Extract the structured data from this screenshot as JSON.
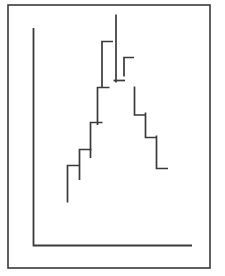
{
  "figure": {
    "title": "",
    "background_color": "#ffffff",
    "ink_color": "#3a3a3a",
    "frame": {
      "name": "outer-border",
      "x": 8,
      "y": 5,
      "width": 202,
      "height": 263,
      "stroke_width": 1.6
    },
    "axes": {
      "name": "axes-lines",
      "stroke_width": 1.8,
      "y_axis": {
        "x": 33.5,
        "y_top": 28,
        "y_bottom": 245.5
      },
      "x_axis": {
        "y": 245.5,
        "x_left": 33.5,
        "x_right": 192
      }
    }
  },
  "chart_data": {
    "type": "bar",
    "title": "",
    "subtitle": "",
    "xlabel": "",
    "ylabel": "",
    "grid": false,
    "legend": null,
    "annotations": [],
    "xlim": [
      0,
      13
    ],
    "ylim": [
      0,
      100
    ],
    "x_tick_labels": [],
    "y_tick_labels": [],
    "categories": [
      "1",
      "2",
      "3",
      "4",
      "5",
      "6",
      "7",
      "8",
      "9",
      "10",
      "11",
      "12"
    ],
    "values": [
      20,
      33,
      47,
      60,
      82,
      100,
      68,
      55,
      42,
      30,
      22,
      8
    ],
    "bars_px": [
      {
        "id": "bar-1",
        "x_left": 67.5,
        "x_right": 79.5,
        "top": 165.5,
        "bottom": 202.5,
        "tick_side": "top"
      },
      {
        "id": "bar-2",
        "x_left": 79.5,
        "x_right": 91.5,
        "top": 149.5,
        "bottom": 180.0,
        "tick_side": "top"
      },
      {
        "id": "bar-3",
        "x_left": 90.5,
        "x_right": 102.5,
        "top": 122.5,
        "bottom": 158.0,
        "tick_side": "top"
      },
      {
        "id": "bar-4",
        "x_left": 97.5,
        "x_right": 109.5,
        "top": 87.5,
        "bottom": 125.0,
        "tick_side": "top"
      },
      {
        "id": "bar-5",
        "x_left": 102.0,
        "x_right": 113.0,
        "top": 41.5,
        "bottom": 87.5,
        "tick_side": "top"
      },
      {
        "id": "bar-6",
        "x_left": 116.0,
        "x_right": 116.0,
        "top": 14.5,
        "bottom": 82.5,
        "tick_side": "spike"
      },
      {
        "id": "bar-7",
        "x_left": 113.5,
        "x_right": 125.0,
        "top": 80.5,
        "bottom": 80.5,
        "tick_side": "top"
      },
      {
        "id": "bar-8",
        "x_left": 124.0,
        "x_right": 134.0,
        "top": 57.5,
        "bottom": 76.5,
        "tick_side": "top"
      },
      {
        "id": "bar-9",
        "x_left": 134.5,
        "x_right": 146.0,
        "top": 86.5,
        "bottom": 115.0,
        "tick_side": "bottom"
      },
      {
        "id": "bar-10",
        "x_left": 145.5,
        "x_right": 157.0,
        "top": 112.5,
        "bottom": 137.5,
        "tick_side": "bottom"
      },
      {
        "id": "bar-11",
        "x_left": 156.5,
        "x_right": 168.0,
        "top": 135.5,
        "bottom": 168.5,
        "tick_side": "bottom"
      }
    ],
    "segments": [
      {
        "name": "step-segment-1",
        "points": "67.5,202.5 67.5,165.5 79.5,165.5"
      },
      {
        "name": "step-segment-2",
        "points": "79.5,180.0 79.5,149.5 91.5,149.5"
      },
      {
        "name": "step-segment-3",
        "points": "90.5,158.0 90.5,122.5 102.5,122.5"
      },
      {
        "name": "step-segment-4",
        "points": "97.5,125.0 97.5,87.5 109.5,87.5"
      },
      {
        "name": "step-segment-5",
        "points": "102.0,87.5 102.0,41.5 113.0,41.5"
      },
      {
        "name": "step-segment-6",
        "points": "116.0,14.5 116.0,82.5"
      },
      {
        "name": "step-segment-7",
        "points": "113.5,80.5 125.0,80.5"
      },
      {
        "name": "step-segment-8",
        "points": "124.0,76.5 124.0,57.5 134.0,57.5"
      },
      {
        "name": "step-segment-9",
        "points": "134.5,86.5 134.5,115.0 146.0,115.0"
      },
      {
        "name": "step-segment-10",
        "points": "145.5,112.5 145.5,137.5 157.0,137.5"
      },
      {
        "name": "step-segment-11",
        "points": "156.5,135.5 156.5,168.5 168.0,168.5"
      }
    ],
    "stroke_width": 1.7
  }
}
